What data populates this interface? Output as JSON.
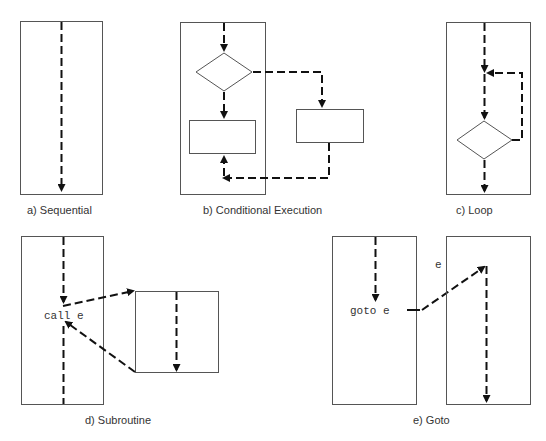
{
  "figure": {
    "panels": [
      {
        "id": "a",
        "caption": "a)  Sequential"
      },
      {
        "id": "b",
        "caption": "b)  Conditional Execution"
      },
      {
        "id": "c",
        "caption": "c)  Loop"
      },
      {
        "id": "d",
        "caption": "d)  Subroutine",
        "call_label": "call e"
      },
      {
        "id": "e",
        "caption": "e)  Goto",
        "goto_label": "goto e",
        "target_label": "e"
      }
    ]
  },
  "colors": {
    "box_stroke": "#555555",
    "flow_stroke": "#111111",
    "text": "#333333",
    "background": "#ffffff"
  }
}
